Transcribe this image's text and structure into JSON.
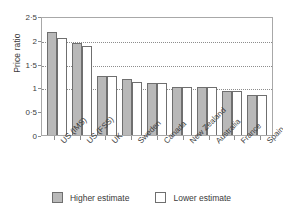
{
  "chart_data": {
    "type": "bar",
    "title": "",
    "xlabel": "",
    "ylabel": "Price ratio",
    "ylim": [
      0,
      2.5
    ],
    "yticks": [
      0,
      0.5,
      1,
      1.5,
      2,
      2.5
    ],
    "ytick_labels": [
      "0",
      "0·5",
      "1",
      "1·5",
      "2",
      "2·5"
    ],
    "grid": "horizontal-dotted",
    "gridlines": [
      1,
      1.5,
      2
    ],
    "legend_position": "bottom-center",
    "categories": [
      "US (IMS)",
      "US (FSS)",
      "UK",
      "Sweden",
      "Canada",
      "New Zealand",
      "Australia",
      "France",
      "Spain"
    ],
    "series": [
      {
        "name": "Higher estimate",
        "color": "#b9b9b9",
        "values": [
          2.17,
          1.94,
          1.25,
          1.18,
          1.09,
          1.0,
          1.0,
          0.92,
          0.85
        ]
      },
      {
        "name": "Lower estimate",
        "color": "#ffffff",
        "values": [
          2.04,
          1.87,
          1.25,
          1.11,
          1.09,
          1.0,
          1.0,
          0.92,
          0.85
        ]
      }
    ]
  },
  "legend": {
    "items": [
      {
        "label": "Higher estimate",
        "swatch": "higher"
      },
      {
        "label": "Lower estimate",
        "swatch": "lower"
      }
    ]
  },
  "colors": {
    "higher_fill": "#b9b9b9",
    "lower_fill": "#ffffff",
    "bar_outline": "#6f6f6f",
    "axis": "#a8a8a8",
    "grid": "#8d8d8d",
    "text": "#3a3a3a"
  }
}
